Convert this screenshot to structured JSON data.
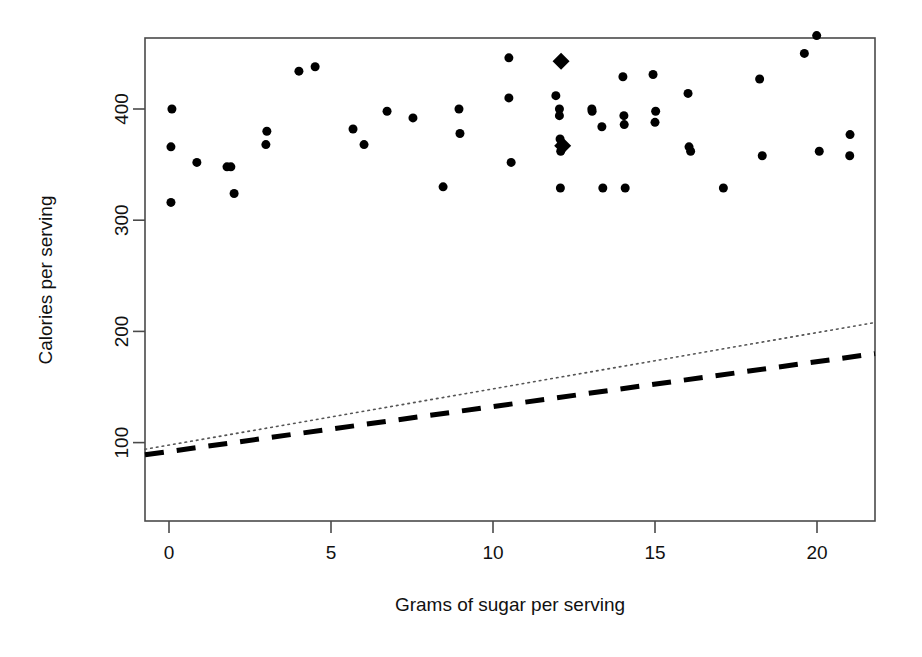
{
  "chart_data": {
    "type": "scatter",
    "title": "",
    "xlabel": "Grams of sugar per serving",
    "ylabel": "Calories per serving",
    "xlim": [
      -1.0,
      21.8
    ],
    "ylim": [
      36,
      454
    ],
    "xticks": [
      0,
      5,
      10,
      15,
      20
    ],
    "xtick_labels": [
      "0",
      "5",
      "10",
      "15",
      "20"
    ],
    "yticks": [
      100,
      200,
      300,
      400
    ],
    "ytick_labels": [
      "100",
      "200",
      "300",
      "400"
    ],
    "grid": false,
    "legend": "none",
    "box": true,
    "series": [
      {
        "name": "cereals",
        "marker": "filled-circle",
        "marker_size": 9,
        "color": "#000000",
        "points": [
          [
            0.09,
            400
          ],
          [
            0.06,
            366
          ],
          [
            0.06,
            316
          ],
          [
            0.86,
            352
          ],
          [
            1.79,
            348
          ],
          [
            1.91,
            348
          ],
          [
            2.01,
            324
          ],
          [
            3.02,
            380
          ],
          [
            2.99,
            368
          ],
          [
            4.01,
            434
          ],
          [
            4.51,
            438
          ],
          [
            5.68,
            382
          ],
          [
            6.02,
            368
          ],
          [
            6.73,
            398
          ],
          [
            7.53,
            392
          ],
          [
            8.46,
            330
          ],
          [
            8.95,
            400
          ],
          [
            8.98,
            378
          ],
          [
            10.49,
            446
          ],
          [
            10.49,
            410
          ],
          [
            10.56,
            352
          ],
          [
            11.94,
            412
          ],
          [
            12.05,
            400
          ],
          [
            12.05,
            394
          ],
          [
            12.07,
            373
          ],
          [
            12.09,
            362
          ],
          [
            12.08,
            329
          ],
          [
            13.05,
            400
          ],
          [
            13.06,
            398
          ],
          [
            13.36,
            384
          ],
          [
            13.39,
            329
          ],
          [
            14.01,
            429
          ],
          [
            14.04,
            394
          ],
          [
            14.05,
            386
          ],
          [
            14.08,
            329
          ],
          [
            14.94,
            431
          ],
          [
            15.0,
            388
          ],
          [
            15.02,
            398
          ],
          [
            16.02,
            414
          ],
          [
            16.05,
            366
          ],
          [
            16.1,
            362
          ],
          [
            17.11,
            329
          ],
          [
            18.23,
            427
          ],
          [
            18.31,
            358
          ],
          [
            19.61,
            450
          ],
          [
            19.99,
            466
          ],
          [
            20.07,
            362
          ],
          [
            21.02,
            377
          ],
          [
            21.01,
            358
          ]
        ]
      },
      {
        "name": "outliers",
        "marker": "filled-diamond",
        "marker_size": 17,
        "color": "#000000",
        "points": [
          [
            12.1,
            443
          ],
          [
            12.15,
            367
          ]
        ]
      }
    ],
    "lines": [
      {
        "name": "ols-fit",
        "style": "dotted",
        "width": 1.6,
        "color": "#555555",
        "x": [
          -1.0,
          21.8
        ],
        "y": [
          94,
          208
        ]
      },
      {
        "name": "robust-fit",
        "style": "dashed",
        "width": 5,
        "color": "#000000",
        "x": [
          -1.0,
          21.8
        ],
        "y": [
          89,
          180
        ]
      }
    ]
  },
  "axis": {
    "x_title": "Grams of sugar per serving",
    "y_title": "Calories per serving",
    "x_tick_labels": [
      "0",
      "5",
      "10",
      "15",
      "20"
    ],
    "y_tick_labels": [
      "100",
      "200",
      "300",
      "400"
    ]
  },
  "colors": {
    "background": "#ffffff",
    "foreground": "#000000",
    "axis": "#4a4a4a",
    "dotted_line": "#555555",
    "dashed_line": "#000000"
  }
}
